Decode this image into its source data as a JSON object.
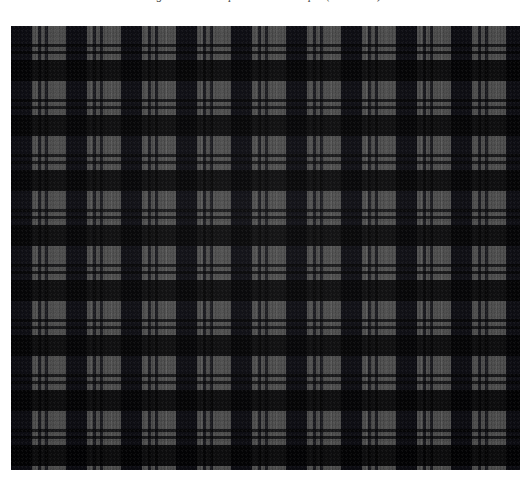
{
  "page": {
    "background_color": "#ffffff",
    "width": 531,
    "height": 497
  },
  "caption": {
    "text": "Figure 1: Tartan plaid weave sample (wool twill).",
    "style": "italic-serif",
    "clipped": "true"
  },
  "figure": {
    "label": "plaid-textile-swatch",
    "x": 11,
    "y": 26,
    "width": 509,
    "height": 444
  },
  "chart_data": {
    "type": "heatmap",
    "xlabel": "",
    "ylabel": "",
    "pattern": "square-check-tartan",
    "sett_repeat_px": 55,
    "weave": "2/2 twill",
    "repeats_horizontal": 9.3,
    "repeats_vertical": 8.1,
    "palette": {
      "ground_gray": "#4d4d4d",
      "dark_block": "#191920",
      "blend_band": "#333338",
      "accent_hairline": "#8a8a8a",
      "page_white": "#ffffff"
    },
    "bands": [
      {
        "name": "dark-block",
        "start_px": 0,
        "width_px": 21,
        "color": "#0a0a10"
      },
      {
        "name": "ground",
        "start_px": 21,
        "width_px": 6,
        "color": "#4d4d4d"
      },
      {
        "name": "accent-pair-a",
        "start_px": 27,
        "width_px": 3,
        "color": "#0c0c12"
      },
      {
        "name": "ground",
        "start_px": 30,
        "width_px": 4,
        "color": "#4d4d4d"
      },
      {
        "name": "accent-pair-b",
        "start_px": 34,
        "width_px": 3,
        "color": "#0c0c12"
      },
      {
        "name": "ground",
        "start_px": 37,
        "width_px": 8,
        "color": "#4d4d4d"
      },
      {
        "name": "hairline",
        "start_px": 45,
        "width_px": 1,
        "color": "#969696"
      },
      {
        "name": "ground",
        "start_px": 46,
        "width_px": 9,
        "color": "#4d4d4d"
      }
    ]
  }
}
